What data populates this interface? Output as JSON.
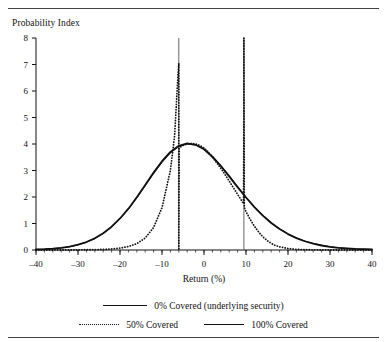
{
  "figure": {
    "y_axis_caption": "Probability Index",
    "x_axis_title": "Return (%)"
  },
  "legend": {
    "entries": [
      {
        "label": "0% Covered (underlying security)",
        "style": "solid-thick",
        "name": "legend-0pct"
      },
      {
        "label": "50% Covered",
        "style": "dotted",
        "name": "legend-50pct"
      },
      {
        "label": "100% Covered",
        "style": "solid-thin",
        "name": "legend-100pct"
      }
    ]
  },
  "chart_data": {
    "type": "line",
    "title": "",
    "xlabel": "Return (%)",
    "ylabel": "Probability Index",
    "xlim": [
      -40,
      40
    ],
    "ylim": [
      0,
      8
    ],
    "xticks": [
      -40,
      -30,
      -20,
      -10,
      0,
      10,
      20,
      30,
      40
    ],
    "xticklabels": [
      "–40",
      "–30",
      "–20",
      "–10",
      "0",
      "10",
      "20",
      "30",
      "40"
    ],
    "yticks": [
      0,
      1,
      2,
      3,
      4,
      5,
      6,
      7,
      8
    ],
    "yticklabels": [
      "0",
      "1",
      "2",
      "3",
      "4",
      "5",
      "6",
      "7",
      "8"
    ],
    "minor_xticks_step": 2,
    "grid": false,
    "legend_position": "below",
    "annotations": [
      {
        "type": "vline",
        "x": -6,
        "y_from": 0,
        "y_to": 8,
        "name": "lower-strike-line"
      },
      {
        "type": "vline",
        "x": 9.5,
        "y_from": 0,
        "y_to": 8,
        "name": "upper-strike-line"
      }
    ],
    "series": [
      {
        "name": "0% Covered (underlying security)",
        "style": "solid",
        "width": 1.8,
        "x": [
          -40,
          -38,
          -36,
          -34,
          -32,
          -30,
          -28,
          -26,
          -24,
          -22,
          -20,
          -18,
          -16,
          -14,
          -12,
          -10,
          -8,
          -6,
          -4,
          -2,
          0,
          2,
          4,
          6,
          8,
          10,
          12,
          14,
          16,
          18,
          20,
          22,
          24,
          26,
          28,
          30,
          32,
          34,
          36,
          38,
          40
        ],
        "y": [
          0.02,
          0.03,
          0.05,
          0.08,
          0.13,
          0.2,
          0.3,
          0.44,
          0.63,
          0.88,
          1.19,
          1.56,
          1.99,
          2.45,
          2.92,
          3.35,
          3.7,
          3.93,
          4.02,
          3.97,
          3.8,
          3.52,
          3.17,
          2.78,
          2.37,
          1.98,
          1.62,
          1.3,
          1.02,
          0.79,
          0.6,
          0.45,
          0.33,
          0.24,
          0.17,
          0.12,
          0.08,
          0.06,
          0.04,
          0.03,
          0.02
        ]
      },
      {
        "name": "50% Covered",
        "style": "dotted",
        "width": 1.8,
        "x": [
          -40,
          -36,
          -32,
          -28,
          -24,
          -22,
          -20,
          -18,
          -16,
          -14,
          -12,
          -10,
          -8,
          -7,
          -6.2,
          -6,
          -6,
          -5.9,
          -5.5,
          -5,
          -4,
          -3,
          -2,
          -1,
          0,
          1,
          2,
          3,
          4,
          5,
          6,
          7,
          8,
          9,
          9.4,
          9.5,
          9.5,
          9.6,
          10,
          11,
          12,
          13,
          14,
          15,
          16,
          17,
          18,
          20,
          22,
          24,
          26,
          28,
          30,
          32,
          34,
          36,
          40
        ],
        "y": [
          0,
          0,
          0,
          0.01,
          0.02,
          0.04,
          0.07,
          0.13,
          0.24,
          0.45,
          0.85,
          1.6,
          3.0,
          4.3,
          6.6,
          7.05,
          0,
          3.85,
          3.9,
          3.95,
          4.0,
          4.02,
          4.0,
          3.95,
          3.85,
          3.7,
          3.5,
          3.3,
          3.08,
          2.85,
          2.6,
          2.35,
          2.1,
          1.85,
          1.75,
          4.85,
          8.0,
          1.6,
          1.45,
          1.15,
          0.9,
          0.68,
          0.5,
          0.36,
          0.25,
          0.17,
          0.12,
          0.055,
          0.025,
          0.012,
          0.006,
          0.003,
          0.001,
          0,
          0,
          0,
          0
        ]
      },
      {
        "name": "100% Covered",
        "style": "solid",
        "width": 0.9,
        "x": [
          -40,
          -38,
          -36,
          -34,
          -32,
          -30,
          -28,
          -26,
          -24,
          -22,
          -20,
          -18,
          -16,
          -14,
          -12,
          -10,
          -8,
          -6,
          -4,
          -2,
          0,
          2,
          4,
          6,
          8,
          10,
          12,
          14,
          16,
          18,
          20,
          22,
          24,
          26,
          28,
          30,
          32,
          34,
          36,
          38,
          40
        ],
        "y": [
          0.02,
          0.03,
          0.05,
          0.08,
          0.12,
          0.19,
          0.29,
          0.43,
          0.62,
          0.87,
          1.17,
          1.54,
          1.96,
          2.42,
          2.88,
          3.3,
          3.66,
          3.9,
          4.0,
          3.96,
          3.82,
          3.55,
          3.2,
          2.81,
          2.4,
          2.0,
          1.64,
          1.32,
          1.04,
          0.8,
          0.61,
          0.46,
          0.34,
          0.25,
          0.18,
          0.12,
          0.09,
          0.06,
          0.04,
          0.03,
          0.02
        ]
      }
    ]
  }
}
